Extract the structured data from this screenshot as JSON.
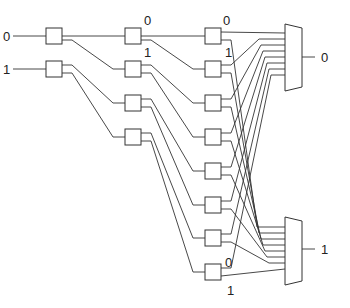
{
  "diagram": {
    "title": "",
    "inputs": [
      {
        "label": "0",
        "y": 36
      },
      {
        "label": "1",
        "y": 69
      }
    ],
    "columns": {
      "col1": {
        "x": 46,
        "boxes_y": [
          28,
          61
        ]
      },
      "col2": {
        "x": 125,
        "boxes_y": [
          28,
          61,
          95,
          129
        ]
      },
      "col3": {
        "x": 205,
        "boxes_y": [
          28,
          61,
          95,
          129,
          163,
          197,
          230,
          264
        ]
      }
    },
    "box_size": {
      "w": 16,
      "h": 16
    },
    "port_labels": {
      "col2_top": {
        "zero": "0",
        "one": "1"
      },
      "col3_top": {
        "zero": "0",
        "one": "1"
      },
      "col3_bottom": {
        "zero": "0",
        "one": "1"
      }
    },
    "muxes": [
      {
        "name": "mux-top",
        "x": 285,
        "y_top": 24,
        "y_bot": 91,
        "output_label": "0",
        "output_y": 57
      },
      {
        "name": "mux-bottom",
        "x": 285,
        "y_top": 217,
        "y_bot": 285,
        "output_label": "1",
        "output_y": 249
      }
    ]
  }
}
